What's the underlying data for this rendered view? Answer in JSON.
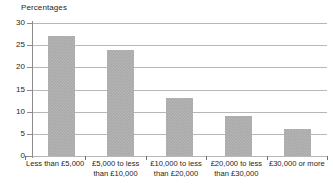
{
  "chart_data": {
    "type": "bar",
    "title": "Percentages",
    "xlabel": "",
    "ylabel": "",
    "categories": [
      "Less than £5,000",
      "£5,000 to less than £10,000",
      "£10,000 to less than £20,000",
      "£20,000 to less than £30,000",
      "£30,000 or more"
    ],
    "category_lines": [
      [
        "Less than £5,000"
      ],
      [
        "£5,000 to less",
        "than £10,000"
      ],
      [
        "£10,000 to less",
        "than £20,000"
      ],
      [
        "£20,000 to less",
        "than £30,000"
      ],
      [
        "£30,000 or more"
      ]
    ],
    "values": [
      27,
      24,
      13,
      9,
      6
    ],
    "ylim": [
      0,
      30
    ],
    "ytick_labels": [
      "30",
      "25",
      "20",
      "15",
      "10",
      "5",
      "0"
    ],
    "ytick_values": [
      30,
      25,
      20,
      15,
      10,
      5,
      0
    ],
    "grid": true,
    "legend": false,
    "bar_color": "#a9a9a9",
    "grid_color": "#b7b7b7",
    "axis_color": "#6f6f6f",
    "text_color": "#231f20"
  }
}
